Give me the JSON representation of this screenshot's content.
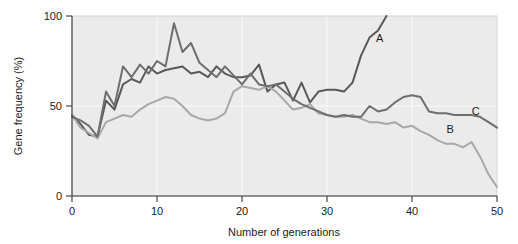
{
  "chart_data": {
    "type": "line",
    "title": "",
    "xlabel": "Number of generations",
    "ylabel": "Gene frequency (%)",
    "xlim": [
      0,
      50
    ],
    "ylim": [
      0,
      100
    ],
    "xticks": [
      0,
      10,
      20,
      30,
      40,
      50
    ],
    "yticks": [
      0,
      50,
      100
    ],
    "xtick_labels": [
      "0",
      "10",
      "20",
      "30",
      "40",
      "50"
    ],
    "ytick_labels": [
      "0",
      "50",
      "100"
    ],
    "grid": true,
    "grid_color": "#fafafa",
    "plot_background": "#ebebeb",
    "legend": "inline-end-labels",
    "legend_position": "right of line ends",
    "series": [
      {
        "name": "A",
        "label": "A",
        "color": "#595959",
        "line_width": 2.0,
        "label_x": 36.2,
        "label_y": 88,
        "x": [
          0,
          1,
          2,
          3,
          4,
          5,
          6,
          7,
          8,
          9,
          10,
          11,
          12,
          13,
          14,
          15,
          16,
          17,
          18,
          19,
          20,
          21,
          22,
          23,
          24,
          25,
          26,
          27,
          28,
          29,
          30,
          31,
          32,
          33,
          34,
          35,
          36,
          37
        ],
        "values": [
          45,
          40,
          34,
          33,
          53,
          48,
          62,
          65,
          63,
          72,
          68,
          70,
          71,
          72,
          68,
          69,
          66,
          72,
          68,
          66,
          66,
          67,
          73,
          58,
          62,
          63,
          53,
          63,
          52,
          58,
          59,
          59,
          58,
          63,
          78,
          88,
          92,
          100
        ]
      },
      {
        "name": "B",
        "label": "B",
        "color": "#a8a8a8",
        "line_width": 2.0,
        "label_x": 44.5,
        "label_y": 37,
        "x": [
          0,
          1,
          2,
          3,
          4,
          5,
          6,
          7,
          8,
          9,
          10,
          11,
          12,
          13,
          14,
          15,
          16,
          17,
          18,
          19,
          20,
          21,
          22,
          23,
          24,
          25,
          26,
          27,
          28,
          29,
          30,
          31,
          32,
          33,
          34,
          35,
          36,
          37,
          38,
          39,
          40,
          41,
          42,
          43,
          44,
          45,
          46,
          47,
          48,
          49,
          50
        ],
        "values": [
          45,
          38,
          35,
          32,
          41,
          43,
          45,
          44,
          48,
          51,
          53,
          55,
          54,
          50,
          45,
          43,
          42,
          43,
          46,
          58,
          61,
          60,
          59,
          61,
          58,
          53,
          48,
          49,
          51,
          46,
          45,
          44,
          44,
          45,
          43,
          41,
          41,
          40,
          41,
          38,
          39,
          36,
          34,
          31,
          29,
          29,
          27,
          30,
          22,
          12,
          5
        ]
      },
      {
        "name": "C",
        "label": "C",
        "color": "#6e6e6e",
        "line_width": 2.0,
        "label_x": 47.5,
        "label_y": 47,
        "x": [
          0,
          1,
          2,
          3,
          4,
          5,
          6,
          7,
          8,
          9,
          10,
          11,
          12,
          13,
          14,
          15,
          16,
          17,
          18,
          19,
          20,
          21,
          22,
          23,
          24,
          25,
          26,
          27,
          28,
          29,
          30,
          31,
          32,
          33,
          34,
          35,
          36,
          37,
          38,
          39,
          40,
          41,
          42,
          43,
          44,
          45,
          46,
          47,
          48,
          49,
          50
        ],
        "values": [
          44,
          42,
          39,
          33,
          58,
          50,
          72,
          66,
          73,
          68,
          75,
          72,
          96,
          80,
          85,
          74,
          70,
          66,
          72,
          67,
          62,
          68,
          62,
          61,
          62,
          58,
          54,
          51,
          49,
          47,
          45,
          44,
          45,
          44,
          44,
          50,
          47,
          48,
          52,
          55,
          56,
          55,
          47,
          46,
          46,
          45,
          45,
          45,
          44,
          41,
          38
        ]
      }
    ]
  }
}
